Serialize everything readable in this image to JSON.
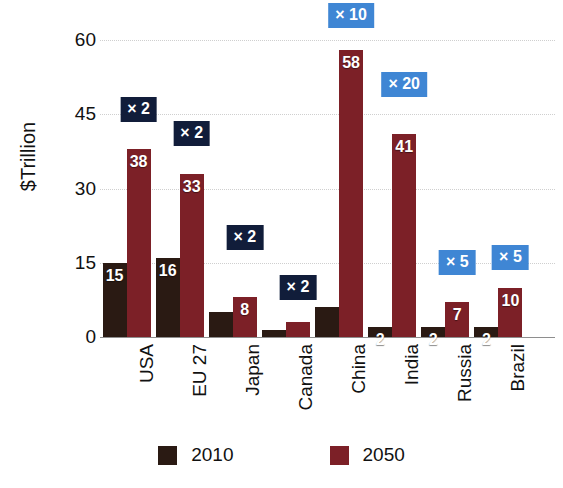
{
  "chart_data": {
    "type": "bar",
    "title": "",
    "xlabel": "",
    "ylabel": "$Trillion",
    "ylim": [
      0,
      60
    ],
    "yticks": [
      0,
      15,
      30,
      45,
      60
    ],
    "grid": true,
    "legend_position": "bottom",
    "categories": [
      "USA",
      "EU 27",
      "Japan",
      "Canada",
      "China",
      "India",
      "Russia",
      "Brazil"
    ],
    "series": [
      {
        "name": "2010",
        "color": "#2a1a13",
        "values": [
          15,
          16,
          5,
          1.5,
          6,
          2,
          2,
          2
        ],
        "labels": [
          "15",
          "16",
          "",
          "",
          "",
          "2",
          "2",
          "2"
        ]
      },
      {
        "name": "2050",
        "color": "#7c2027",
        "values": [
          38,
          33,
          8,
          3,
          58,
          41,
          7,
          10
        ],
        "labels": [
          "38",
          "33",
          "8",
          "",
          "58",
          "41",
          "7",
          "10"
        ]
      }
    ],
    "multipliers": [
      {
        "category": "USA",
        "label": "× 2",
        "style": "navy",
        "y": 43.5
      },
      {
        "category": "EU 27",
        "label": "× 2",
        "style": "navy",
        "y": 38.5
      },
      {
        "category": "Japan",
        "label": "× 2",
        "style": "navy",
        "y": 17.5
      },
      {
        "category": "Canada",
        "label": "× 2",
        "style": "navy",
        "y": 7.5
      },
      {
        "category": "China",
        "label": "× 10",
        "style": "blue",
        "y": 62.5
      },
      {
        "category": "India",
        "label": "× 20",
        "style": "blue",
        "y": 48.5
      },
      {
        "category": "Russia",
        "label": "× 5",
        "style": "blue",
        "y": 12.5
      },
      {
        "category": "Brazil",
        "label": "× 5",
        "style": "blue",
        "y": 13.5
      }
    ]
  },
  "colors": {
    "series_2010": "#2a1a13",
    "series_2050": "#7c2027",
    "badge_navy": "#111d3a",
    "badge_blue": "#3f86d4",
    "gridline": "#cfcfcf",
    "axis": "#8e8e8e",
    "text": "#111111",
    "background": "#ffffff"
  }
}
